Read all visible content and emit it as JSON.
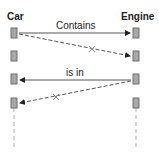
{
  "diagram": {
    "type": "sequence",
    "lifelines": [
      {
        "name": "Car",
        "x": 14
      },
      {
        "name": "Engine",
        "x": 136
      }
    ],
    "messages": [
      {
        "label": "Contains",
        "from": "Car",
        "to": "Engine",
        "style": "solid",
        "y_from": 33,
        "y_to": 33
      },
      {
        "label": "",
        "from": "Car",
        "to": "Engine",
        "style": "dashed",
        "crossed": true,
        "y_from": 34,
        "y_to": 57
      },
      {
        "label": "is in",
        "from": "Engine",
        "to": "Car",
        "style": "solid",
        "y_from": 80,
        "y_to": 80
      },
      {
        "label": "",
        "from": "Engine",
        "to": "Car",
        "style": "dashed",
        "crossed": true,
        "y_from": 81,
        "y_to": 104
      }
    ],
    "colors": {
      "box_fill": "#a8a8a8",
      "box_border": "#6e6e6e",
      "line": "#333333",
      "lifeline": "#aaaaaa"
    }
  }
}
